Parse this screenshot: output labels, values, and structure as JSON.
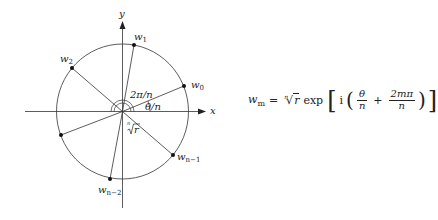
{
  "diagram": {
    "center": {
      "x": 122.5,
      "y": 111.5
    },
    "radius_x": 66,
    "radius_y": 68,
    "axes": {
      "x_label": "x",
      "y_label": "y"
    },
    "points": [
      {
        "id": "w0",
        "label_base": "w",
        "label_sub": "0",
        "x": 184,
        "y": 86
      },
      {
        "id": "w1",
        "label_base": "w",
        "label_sub": "1",
        "x": 134,
        "y": 45
      },
      {
        "id": "w2",
        "label_base": "w",
        "label_sub": "2",
        "x": 72,
        "y": 68
      },
      {
        "id": "w_unlabeled",
        "label_base": "",
        "label_sub": "",
        "x": 61,
        "y": 135
      },
      {
        "id": "wn-2",
        "label_base": "w",
        "label_sub": "n−2",
        "x": 110,
        "y": 179
      },
      {
        "id": "wn-1",
        "label_base": "w",
        "label_sub": "n−1",
        "x": 173,
        "y": 155
      }
    ],
    "angle_labels": {
      "two_pi_over_n": "2π/n",
      "theta_over_n": "θ/n"
    },
    "radius_label": {
      "index": "n",
      "radicand": "r"
    },
    "colors": {
      "stroke": "#333333",
      "text": "#222222",
      "background": "#ffffff"
    }
  },
  "formula": {
    "lhs_base": "w",
    "lhs_sub": "m",
    "equals": "=",
    "root_index": "n",
    "root_radicand": "r",
    "func": "exp",
    "lbracket": "[",
    "rbracket": "]",
    "imag": "i",
    "lparen": "(",
    "rparen": ")",
    "frac1_num": "θ",
    "frac1_den": "n",
    "plus": "+",
    "frac2_num": "2mπ",
    "frac2_den": "n"
  }
}
